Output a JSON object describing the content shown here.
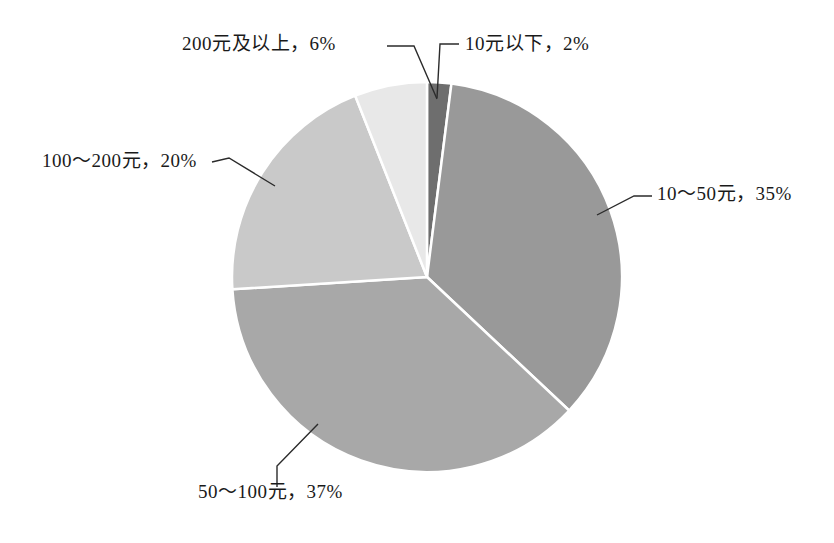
{
  "chart_data": {
    "type": "pie",
    "title": "",
    "subtitle": "",
    "xlabel": "",
    "ylabel": "",
    "legend_position": "none",
    "grid": false,
    "labels_unit": "%",
    "start_angle_deg": 0,
    "direction": "clockwise",
    "categories": [
      "10元以下",
      "10～50元",
      "50～100元",
      "100～200元",
      "200元及以上"
    ],
    "values": [
      2,
      35,
      37,
      20,
      6
    ],
    "slices": [
      {
        "name": "slice-10-under",
        "category": "10元以下",
        "value": 2,
        "label": "10元以下，2%",
        "color": "#6e6e6e",
        "start_deg": 0,
        "end_deg": 7.2
      },
      {
        "name": "slice-10-50",
        "category": "10～50元",
        "value": 35,
        "label": "10～50元，35%",
        "color": "#999999",
        "start_deg": 7.2,
        "end_deg": 133.2
      },
      {
        "name": "slice-50-100",
        "category": "50～100元",
        "value": 37,
        "label": "50～100元，37%",
        "color": "#a8a8a8",
        "start_deg": 133.2,
        "end_deg": 266.4
      },
      {
        "name": "slice-100-200",
        "category": "100～200元",
        "value": 20,
        "label": "100～200元，20%",
        "color": "#c9c9c9",
        "start_deg": 266.4,
        "end_deg": 338.4
      },
      {
        "name": "slice-200-plus",
        "category": "200元及以上",
        "value": 6,
        "label": "200元及以上，6%",
        "color": "#e8e8e8",
        "start_deg": 338.4,
        "end_deg": 360
      }
    ]
  },
  "labels": {
    "above_200": "200元及以上，6%",
    "under_10": "10元以下，2%",
    "from_100_to_200": "100～200元，20%",
    "from_10_to_50": "10～50元，35%",
    "from_50_to_100": "50～100元，37%"
  },
  "colors": {
    "background": "#ffffff",
    "text": "#1a1a1a",
    "leader_line": "#2b2b2b",
    "slice_separator": "#ffffff"
  }
}
